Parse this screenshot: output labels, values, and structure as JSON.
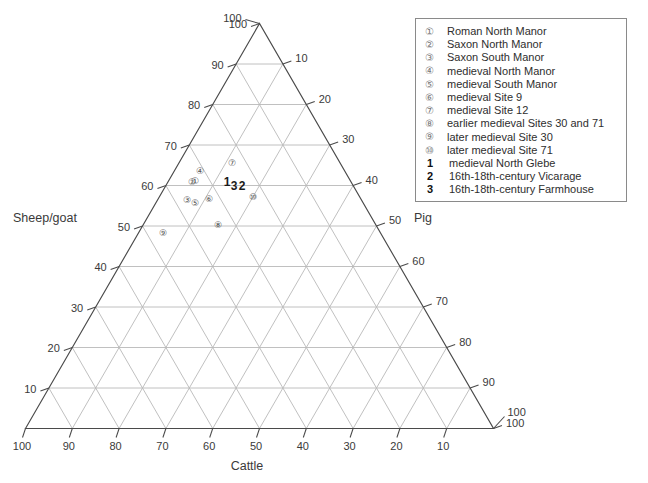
{
  "chart_data": {
    "type": "scatter",
    "plot_kind": "ternary",
    "title": "",
    "axes": {
      "bottom": {
        "name": "Cattle",
        "ticks": [
          100,
          90,
          80,
          70,
          60,
          50,
          40,
          30,
          20,
          10
        ]
      },
      "left": {
        "name": "Sheep/goat",
        "ticks": [
          100,
          90,
          80,
          70,
          60,
          50,
          40,
          30,
          20,
          10
        ]
      },
      "right": {
        "name": "Pig",
        "ticks": [
          10,
          20,
          30,
          40,
          50,
          60,
          70,
          80,
          90,
          100
        ]
      }
    },
    "grid": true,
    "legend_position": "top-right",
    "points": [
      {
        "key": "1",
        "marker": "circled",
        "label": "Roman North Manor",
        "cattle": 36,
        "sheepgoat": 59,
        "pig": 5
      },
      {
        "key": "2",
        "marker": "circled",
        "label": "Saxon North Manor",
        "cattle": 38,
        "sheepgoat": 57,
        "pig": 5
      },
      {
        "key": "3",
        "marker": "circled",
        "label": "Saxon South Manor",
        "cattle": 42,
        "sheepgoat": 50,
        "pig": 8
      },
      {
        "key": "4",
        "marker": "circled",
        "label": "medieval North Manor",
        "cattle": 33,
        "sheepgoat": 62,
        "pig": 5
      },
      {
        "key": "5",
        "marker": "circled",
        "label": "medieval South Manor",
        "cattle": 41,
        "sheepgoat": 49,
        "pig": 10
      },
      {
        "key": "6",
        "marker": "circled",
        "label": "medieval Site 9",
        "cattle": 38,
        "sheepgoat": 50,
        "pig": 12
      },
      {
        "key": "7",
        "marker": "circled",
        "label": "medieval Site 12",
        "cattle": 28,
        "sheepgoat": 57,
        "pig": 15
      },
      {
        "key": "8",
        "marker": "circled",
        "label": "earlier medieval Sites 30 and 71",
        "cattle": 38,
        "sheepgoat": 44,
        "pig": 18
      },
      {
        "key": "9",
        "marker": "circled",
        "label": "later medieval Site 30",
        "cattle": 50,
        "sheepgoat": 42,
        "pig": 8
      },
      {
        "key": "10",
        "marker": "circled",
        "label": "later medieval Site 71",
        "cattle": 29,
        "sheepgoat": 49,
        "pig": 22
      },
      {
        "key": "1",
        "marker": "bold",
        "label": "medieval North Glebe",
        "cattle": 33,
        "sheepgoat": 54,
        "pig": 13
      },
      {
        "key": "2",
        "marker": "bold",
        "label": "16th-18th-century Vicarage",
        "cattle": 31,
        "sheepgoat": 53,
        "pig": 16
      },
      {
        "key": "3",
        "marker": "bold",
        "label": "16th-18th-century Farmhouse",
        "cattle": 32,
        "sheepgoat": 53,
        "pig": 15
      }
    ]
  },
  "axis_titles": {
    "bottom": "Cattle",
    "left": "Sheep/goat",
    "right": "Pig"
  },
  "bottom_ticks": [
    "100",
    "90",
    "80",
    "70",
    "60",
    "50",
    "40",
    "30",
    "20",
    "10",
    "100"
  ],
  "left_ticks": [
    "100",
    "90",
    "80",
    "70",
    "60",
    "50",
    "40",
    "30",
    "20",
    "10"
  ],
  "right_ticks": [
    "10",
    "20",
    "30",
    "40",
    "50",
    "60",
    "70",
    "80",
    "90",
    "100"
  ],
  "legend": {
    "entries": [
      {
        "key": "①",
        "bold": false,
        "label": "Roman North Manor"
      },
      {
        "key": "②",
        "bold": false,
        "label": "Saxon North Manor"
      },
      {
        "key": "③",
        "bold": false,
        "label": "Saxon South Manor"
      },
      {
        "key": "④",
        "bold": false,
        "label": "medieval North Manor"
      },
      {
        "key": "⑤",
        "bold": false,
        "label": "medieval South Manor"
      },
      {
        "key": "⑥",
        "bold": false,
        "label": "medieval Site 9"
      },
      {
        "key": "⑦",
        "bold": false,
        "label": "medieval Site 12"
      },
      {
        "key": "⑧",
        "bold": false,
        "label": "earlier medieval Sites 30 and 71"
      },
      {
        "key": "⑨",
        "bold": false,
        "label": "later medieval Site 30"
      },
      {
        "key": "⑩",
        "bold": false,
        "label": "later medieval Site 71"
      },
      {
        "key": "1",
        "bold": true,
        "label": "medieval North Glebe"
      },
      {
        "key": "2",
        "bold": true,
        "label": "16th-18th-century Vicarage"
      },
      {
        "key": "3",
        "bold": true,
        "label": "16th-18th-century Farmhouse"
      }
    ]
  },
  "plot_markers": [
    {
      "name": "point-1",
      "glyph": "①",
      "x": 194.5,
      "y": 184.0,
      "bold": false
    },
    {
      "name": "point-2",
      "glyph": "②",
      "x": 192.0,
      "y": 184.5,
      "bold": false
    },
    {
      "name": "point-3",
      "glyph": "③",
      "x": 186.5,
      "y": 203.0,
      "bold": false
    },
    {
      "name": "point-4",
      "glyph": "④",
      "x": 199.5,
      "y": 174.0,
      "bold": false
    },
    {
      "name": "point-5",
      "glyph": "⑤",
      "x": 194.5,
      "y": 205.5,
      "bold": false
    },
    {
      "name": "point-6",
      "glyph": "⑥",
      "x": 208.5,
      "y": 202.0,
      "bold": false
    },
    {
      "name": "point-7",
      "glyph": "⑦",
      "x": 232.0,
      "y": 165.5,
      "bold": false
    },
    {
      "name": "point-8",
      "glyph": "⑧",
      "x": 217.5,
      "y": 228.0,
      "bold": false
    },
    {
      "name": "point-9",
      "glyph": "⑨",
      "x": 163.0,
      "y": 236.0,
      "bold": false
    },
    {
      "name": "point-10",
      "glyph": "⑩",
      "x": 252.5,
      "y": 199.5,
      "bold": false
    },
    {
      "name": "point-bold-1",
      "glyph": "1",
      "x": 227.0,
      "y": 186.0,
      "bold": true
    },
    {
      "name": "point-bold-3",
      "glyph": "3",
      "x": 234.0,
      "y": 190.0,
      "bold": true
    },
    {
      "name": "point-bold-2",
      "glyph": "2",
      "x": 242.0,
      "y": 189.5,
      "bold": true
    }
  ],
  "colors": {
    "grid": "#b9b9b9",
    "outline": "#4a4a4a",
    "text": "#3a3a3a",
    "legend_border": "#8a8a8a",
    "background": "#ffffff"
  }
}
